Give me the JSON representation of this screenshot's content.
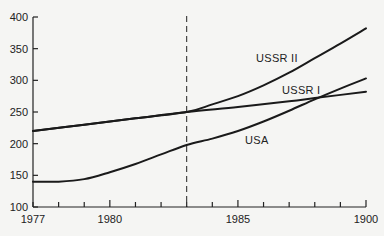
{
  "chart_data": {
    "type": "line",
    "title": "",
    "xlabel": "",
    "ylabel": "",
    "xlim": [
      1977,
      1990
    ],
    "ylim": [
      100,
      400
    ],
    "grid": false,
    "legend": "inline labels",
    "x_ticks": [
      1977,
      1978,
      1979,
      1980,
      1981,
      1982,
      1983,
      1984,
      1985,
      1986,
      1987,
      1988,
      1989,
      1990
    ],
    "x_tick_labels": [
      {
        "value": 1977,
        "label": "1977"
      },
      {
        "value": 1980,
        "label": "1980"
      },
      {
        "value": 1985,
        "label": "1985"
      },
      {
        "value": 1990,
        "label": "1900"
      }
    ],
    "y_ticks": [
      100,
      150,
      200,
      250,
      300,
      350,
      400
    ],
    "y_tick_labels": [
      "100",
      "150",
      "200",
      "250",
      "300",
      "350",
      "400"
    ],
    "annotations": [
      {
        "type": "vertical-dashed-line",
        "x": 1983
      }
    ],
    "series": [
      {
        "name": "USSR II",
        "x": [
          1977,
          1979,
          1981,
          1983,
          1984,
          1985,
          1986,
          1987,
          1988,
          1989,
          1990
        ],
        "values": [
          220,
          230,
          240,
          250,
          262,
          275,
          292,
          312,
          335,
          358,
          382
        ]
      },
      {
        "name": "USSR I",
        "x": [
          1977,
          1979,
          1981,
          1983,
          1985,
          1987,
          1988,
          1990
        ],
        "values": [
          220,
          230,
          240,
          250,
          258,
          267,
          272,
          282
        ]
      },
      {
        "name": "USA",
        "x": [
          1977,
          1978,
          1979,
          1980,
          1981,
          1982,
          1983,
          1984,
          1985,
          1986,
          1987,
          1988,
          1989,
          1990
        ],
        "values": [
          140,
          140,
          144,
          155,
          168,
          183,
          198,
          208,
          220,
          235,
          252,
          270,
          287,
          303
        ]
      }
    ]
  },
  "labels": {
    "ussr2": "USSR II",
    "ussr1": "USSR I",
    "usa": "USA"
  }
}
